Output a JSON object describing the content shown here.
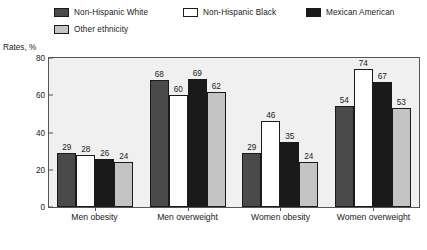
{
  "axis": {
    "y_title": "Rates, %",
    "y_ticks": [
      0,
      20,
      40,
      60,
      80
    ],
    "y_min": 0,
    "y_max": 80
  },
  "legend": {
    "items": [
      {
        "label": "Non-Hispanic White",
        "color": "#4a4a4a",
        "icon": "legend-swatch-icon"
      },
      {
        "label": "Non-Hispanic Black",
        "color": "#ffffff",
        "icon": "legend-swatch-icon"
      },
      {
        "label": "Mexican American",
        "color": "#1a1a1a",
        "icon": "legend-swatch-icon"
      },
      {
        "label": "Other ethnicity",
        "color": "#c4c4c4",
        "icon": "legend-swatch-icon"
      }
    ]
  },
  "chart_data": {
    "type": "bar",
    "title": "",
    "xlabel": "",
    "ylabel": "Rates, %",
    "ylim": [
      0,
      80
    ],
    "yticks": [
      0,
      20,
      40,
      60,
      80
    ],
    "grid": false,
    "legend_position": "top",
    "categories": [
      "Men obesity",
      "Men overweight",
      "Women obesity",
      "Women overweight"
    ],
    "series": [
      {
        "name": "Non-Hispanic White",
        "color": "#4a4a4a",
        "values": [
          29,
          68,
          29,
          54
        ]
      },
      {
        "name": "Non-Hispanic Black",
        "color": "#ffffff",
        "values": [
          28,
          60,
          46,
          74
        ]
      },
      {
        "name": "Mexican American",
        "color": "#1a1a1a",
        "values": [
          26,
          69,
          35,
          67
        ]
      },
      {
        "name": "Other ethnicity",
        "color": "#c4c4c4",
        "values": [
          24,
          62,
          24,
          53
        ]
      }
    ]
  },
  "style": {
    "plot_background": "#f0f0f0",
    "frame_color": "#555555",
    "text_color": "#1a1a1a"
  }
}
